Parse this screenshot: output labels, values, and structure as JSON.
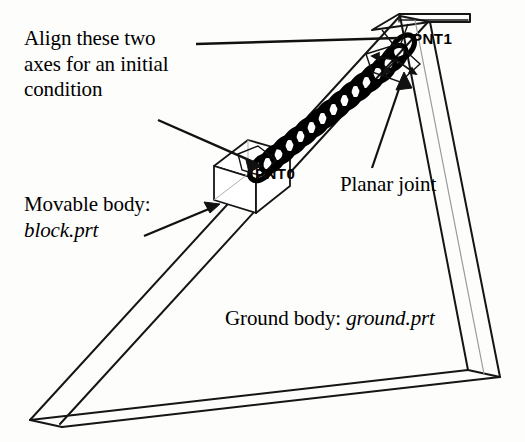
{
  "figure": {
    "kind": "mechanism-assembly-diagram",
    "background_color": "#fdfdfc",
    "line_color": "#111111"
  },
  "annotations": {
    "align_note": {
      "line1": "Align these two",
      "line2": "axes for an initial",
      "line3": "condition"
    },
    "movable_body": {
      "prefix": "Movable body:",
      "part": "block.prt"
    },
    "planar_joint": {
      "label": "Planar joint"
    },
    "ground_body": {
      "prefix": "Ground body:",
      "part": "ground.prt"
    }
  },
  "datums": {
    "pnt1": "PNT1",
    "pnt0": "PNT0"
  },
  "geometry": {
    "spring": {
      "coil_count": 13,
      "stroke_width": 5
    },
    "wedge": {
      "name": "ground-wedge"
    },
    "block": {
      "name": "movable-block"
    },
    "triad": {
      "name": "coordinate-triad",
      "axis_count": 3
    }
  }
}
